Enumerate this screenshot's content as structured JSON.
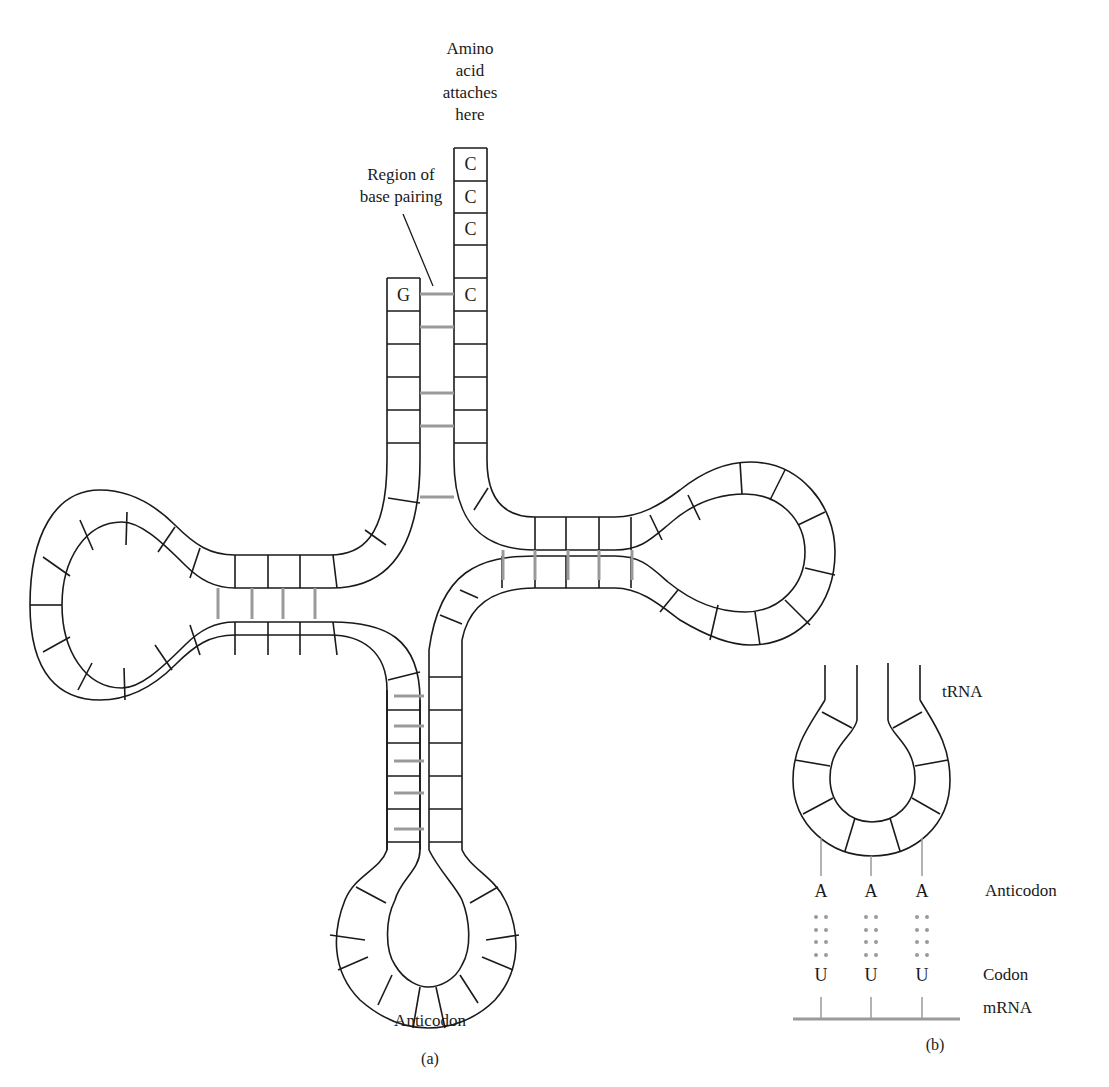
{
  "panel_a": {
    "caption": "(a)",
    "amino_acid_label": [
      "Amino",
      "acid",
      "attaches",
      "here"
    ],
    "base_pairing_label": [
      "Region of",
      "base pairing"
    ],
    "acceptor_stem_3prime": [
      "C",
      "C",
      "C",
      "",
      "C"
    ],
    "acceptor_stem_5prime": "G",
    "anticodon_label": "Anticodon"
  },
  "panel_b": {
    "caption": "(b)",
    "trna_label": "tRNA",
    "anticodon_bases": [
      "A",
      "A",
      "A"
    ],
    "anticodon_label": "Anticodon",
    "codon_bases": [
      "U",
      "U",
      "U"
    ],
    "codon_label": "Codon",
    "mrna_label": "mRNA"
  },
  "colors": {
    "stroke": "#1a1a1a",
    "bond": "#9a9a9a",
    "background": "#ffffff"
  }
}
